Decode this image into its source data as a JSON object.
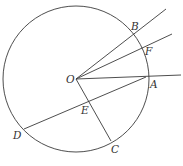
{
  "diagram": {
    "type": "circle-geometry",
    "circle": {
      "center": "O",
      "cx": 76,
      "cy": 79,
      "r": 73
    },
    "points": [
      {
        "name": "O",
        "x": 76,
        "y": 79,
        "label_x": 66,
        "label_y": 83
      },
      {
        "name": "B",
        "x": 132,
        "y": 33,
        "label_x": 131,
        "label_y": 30
      },
      {
        "name": "F",
        "x": 143,
        "y": 49,
        "label_x": 145,
        "label_y": 55
      },
      {
        "name": "A",
        "x": 146,
        "y": 77,
        "label_x": 150,
        "label_y": 88
      },
      {
        "name": "E",
        "x": 88,
        "y": 101,
        "label_x": 81,
        "label_y": 114
      },
      {
        "name": "D",
        "x": 24,
        "y": 129,
        "label_x": 13,
        "label_y": 139
      },
      {
        "name": "C",
        "x": 111,
        "y": 141,
        "label_x": 111,
        "label_y": 153
      }
    ],
    "segments": [
      {
        "name": "ray-OB",
        "from": "O",
        "x1": 76,
        "y1": 79,
        "x2": 166,
        "y2": 9
      },
      {
        "name": "ray-OF",
        "from": "O",
        "x1": 76,
        "y1": 79,
        "x2": 172,
        "y2": 34
      },
      {
        "name": "ray-OA",
        "from": "O",
        "x1": 76,
        "y1": 79,
        "x2": 181,
        "y2": 75
      },
      {
        "name": "segment-OC",
        "from": "O",
        "x1": 76,
        "y1": 79,
        "x2": 111,
        "y2": 141
      },
      {
        "name": "chord-DA",
        "from": "D",
        "x1": 24,
        "y1": 129,
        "x2": 146,
        "y2": 77
      }
    ],
    "labels": [
      "B",
      "F",
      "O",
      "A",
      "E",
      "D",
      "C"
    ]
  }
}
